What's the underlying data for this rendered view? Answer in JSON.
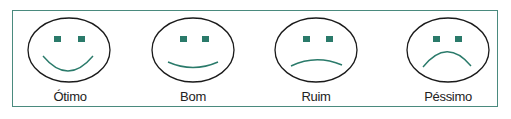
{
  "colors": {
    "frame": "#4a8a7e",
    "feature": "#2a7a6a",
    "outline": "#1a1a1a",
    "text": "#222222"
  },
  "faces": [
    {
      "label": "Ótimo",
      "expression": "big-smile"
    },
    {
      "label": "Bom",
      "expression": "slight-smile"
    },
    {
      "label": "Ruim",
      "expression": "slight-frown"
    },
    {
      "label": "Péssimo",
      "expression": "big-frown"
    }
  ]
}
